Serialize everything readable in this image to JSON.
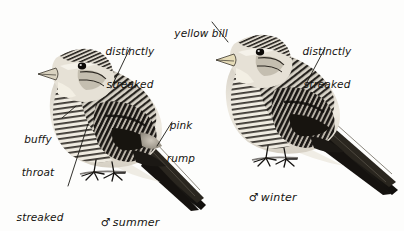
{
  "plate": {
    "background_color": "#fdfdfc",
    "ink_color": "#15130f",
    "width": 404,
    "height": 231,
    "subject": "twite-like finch field guide plate"
  },
  "annotations": [
    {
      "id": "distinctly-streaked-left",
      "text_lines": [
        "distinctly",
        "streaked"
      ],
      "line1": "distinctly",
      "line2": "streaked",
      "x": 97,
      "y": 24,
      "width": 66,
      "align": "center",
      "leader": {
        "x1": 130,
        "y1": 48,
        "x2": 111,
        "y2": 88
      }
    },
    {
      "id": "yellow-bill",
      "text_lines": [
        "yellow bill"
      ],
      "line1": "yellow bill",
      "x": 170,
      "y": 6,
      "width": 62,
      "align": "center",
      "leader": {
        "x1": 212,
        "y1": 22,
        "x2": 228,
        "y2": 42
      }
    },
    {
      "id": "distinctly-streaked-right",
      "text_lines": [
        "distinctly",
        "streaked"
      ],
      "line1": "distinctly",
      "line2": "streaked",
      "x": 294,
      "y": 24,
      "width": 66,
      "align": "center",
      "leader": {
        "x1": 325,
        "y1": 48,
        "x2": 306,
        "y2": 84
      }
    },
    {
      "id": "pink-rump",
      "text_lines": [
        "pink",
        "rump"
      ],
      "line1": "pink",
      "line2": "rump",
      "x": 161,
      "y": 98,
      "width": 40,
      "align": "center",
      "leader": {
        "x1": 172,
        "y1": 122,
        "x2": 157,
        "y2": 146
      }
    },
    {
      "id": "buffy-throat",
      "text_lines": [
        "buffy",
        "throat"
      ],
      "line1": "buffy",
      "line2": "throat",
      "x": 14,
      "y": 112,
      "width": 48,
      "align": "center",
      "leader": {
        "x1": 62,
        "y1": 118,
        "x2": 76,
        "y2": 106
      }
    },
    {
      "id": "streaked-black-on-buff",
      "text_lines": [
        "streaked",
        "black on",
        "buff"
      ],
      "line1": "streaked",
      "line2": "black on",
      "line3": "buff",
      "x": 11,
      "y": 190,
      "width": 58,
      "align": "center",
      "leader": {
        "x1": 68,
        "y1": 186,
        "x2": 88,
        "y2": 124
      }
    }
  ],
  "captions": [
    {
      "id": "male-summer",
      "symbol": "♂",
      "symbol_name": "male-symbol",
      "text": "summer",
      "x": 86,
      "y": 203
    },
    {
      "id": "male-winter",
      "symbol": "♂",
      "symbol_name": "male-symbol",
      "text": "winter",
      "x": 234,
      "y": 178
    }
  ],
  "figures": [
    {
      "id": "bird-left",
      "name": "bird-summer-male",
      "pose": "perched, facing left, tail to lower right",
      "bbox": {
        "x": 38,
        "y": 42,
        "width": 172,
        "height": 175
      }
    },
    {
      "id": "bird-right",
      "name": "bird-winter-male",
      "pose": "perched, facing left, tail to lower right",
      "bbox": {
        "x": 214,
        "y": 26,
        "width": 188,
        "height": 170
      }
    }
  ]
}
